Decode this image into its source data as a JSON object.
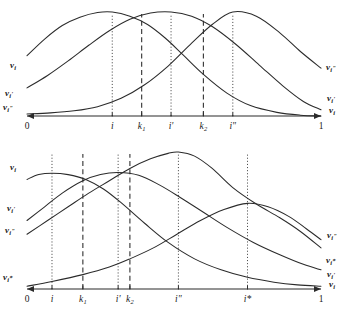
{
  "figure": {
    "title": "",
    "background": "#ffffff",
    "ink": "#2b2b2b"
  },
  "chart_data": [
    {
      "type": "line",
      "id": "top-panel",
      "title": "",
      "xlabel": "",
      "ylabel": "",
      "xlim": [
        0,
        1
      ],
      "ylim": [
        0,
        1
      ],
      "grid": false,
      "legend_position": "inline-curve-ends",
      "xtick_labels": [
        "0",
        "i",
        "k₁",
        "i'",
        "k₂",
        "i\"",
        "1"
      ],
      "xtick_values": [
        0.0,
        0.29,
        0.39,
        0.49,
        0.6,
        0.7,
        1.0
      ],
      "vertical_lines": [
        {
          "at": "i",
          "x": 0.29,
          "style": "dotted"
        },
        {
          "at": "k₁",
          "x": 0.39,
          "style": "dashed"
        },
        {
          "at": "i'",
          "x": 0.49,
          "style": "dotted"
        },
        {
          "at": "k₂",
          "x": 0.6,
          "style": "dashed"
        },
        {
          "at": "i\"",
          "x": 0.7,
          "style": "dotted"
        }
      ],
      "series": [
        {
          "name": "v_i",
          "label_left": "v",
          "label_left_sub": "i",
          "label_left_sup": "",
          "label_right": "",
          "peak_x": 0.29,
          "x": [
            0.0,
            0.06,
            0.12,
            0.18,
            0.24,
            0.29,
            0.35,
            0.41,
            0.47,
            0.53,
            0.6,
            0.68,
            0.76,
            0.85,
            0.93,
            1.0
          ],
          "y": [
            0.58,
            0.74,
            0.87,
            0.95,
            0.995,
            1.0,
            0.96,
            0.88,
            0.75,
            0.59,
            0.4,
            0.22,
            0.1,
            0.035,
            0.008,
            0.0
          ]
        },
        {
          "name": "v_i'",
          "label_left": "v",
          "label_left_sub": "i",
          "label_left_sup": "'",
          "label_right": "",
          "peak_x": 0.49,
          "x": [
            0.0,
            0.07,
            0.14,
            0.21,
            0.28,
            0.35,
            0.42,
            0.49,
            0.56,
            0.63,
            0.71,
            0.79,
            0.87,
            0.94,
            1.0
          ],
          "y": [
            0.27,
            0.39,
            0.53,
            0.68,
            0.82,
            0.93,
            0.99,
            1.0,
            0.96,
            0.86,
            0.69,
            0.49,
            0.29,
            0.14,
            0.06
          ]
        },
        {
          "name": "v_i\"",
          "label_left": "v",
          "label_left_sub": "i",
          "label_left_sup": "\"",
          "label_right": "",
          "peak_x": 0.7,
          "x": [
            0.0,
            0.08,
            0.16,
            0.24,
            0.32,
            0.4,
            0.48,
            0.56,
            0.63,
            0.7,
            0.78,
            0.86,
            0.93,
            1.0
          ],
          "y": [
            0.02,
            0.03,
            0.05,
            0.09,
            0.17,
            0.3,
            0.48,
            0.7,
            0.88,
            1.0,
            0.96,
            0.8,
            0.62,
            0.46
          ]
        }
      ],
      "left_labels": [
        "v_i",
        "v_i'",
        "v_i\""
      ],
      "right_labels": [
        "v_i\"",
        "v_i'",
        "v_i"
      ]
    },
    {
      "type": "line",
      "id": "bottom-panel",
      "title": "",
      "xlabel": "",
      "ylabel": "",
      "xlim": [
        0,
        1
      ],
      "ylim": [
        0,
        1
      ],
      "grid": false,
      "legend_position": "inline-curve-ends",
      "xtick_labels": [
        "0",
        "i",
        "k₁",
        "i'",
        "k₂",
        "i\"",
        "i*",
        "1"
      ],
      "xtick_values": [
        0.0,
        0.085,
        0.19,
        0.31,
        0.35,
        0.515,
        0.75,
        1.0
      ],
      "vertical_lines": [
        {
          "at": "i",
          "x": 0.085,
          "style": "dotted"
        },
        {
          "at": "k₁",
          "x": 0.19,
          "style": "dashed"
        },
        {
          "at": "i'",
          "x": 0.31,
          "style": "dotted"
        },
        {
          "at": "k₂",
          "x": 0.35,
          "style": "dashed"
        },
        {
          "at": "i\"",
          "x": 0.515,
          "style": "dotted"
        },
        {
          "at": "i*",
          "x": 0.75,
          "style": "dotted"
        }
      ],
      "series": [
        {
          "name": "v_i",
          "label_left": "v_i",
          "label_right": "v_i",
          "peak_x": 0.085,
          "x": [
            0.0,
            0.04,
            0.085,
            0.14,
            0.2,
            0.26,
            0.32,
            0.4,
            0.48,
            0.57,
            0.66,
            0.75,
            0.84,
            0.92,
            1.0
          ],
          "y": [
            0.8,
            0.835,
            0.845,
            0.835,
            0.8,
            0.73,
            0.63,
            0.48,
            0.34,
            0.22,
            0.14,
            0.085,
            0.05,
            0.03,
            0.02
          ]
        },
        {
          "name": "v_i'",
          "label_left": "v_i'",
          "label_right": "v_i'",
          "peak_x": 0.31,
          "x": [
            0.0,
            0.06,
            0.12,
            0.19,
            0.25,
            0.31,
            0.38,
            0.45,
            0.52,
            0.6,
            0.68,
            0.77,
            0.86,
            0.94,
            1.0
          ],
          "y": [
            0.5,
            0.6,
            0.7,
            0.79,
            0.835,
            0.85,
            0.83,
            0.76,
            0.67,
            0.56,
            0.45,
            0.34,
            0.25,
            0.18,
            0.14
          ]
        },
        {
          "name": "v_i\"",
          "label_left": "v_i\"",
          "label_right": "v_i\"",
          "peak_x": 0.515,
          "x": [
            0.0,
            0.07,
            0.14,
            0.21,
            0.28,
            0.35,
            0.42,
            0.48,
            0.515,
            0.57,
            0.63,
            0.7,
            0.78,
            0.86,
            0.93,
            1.0
          ],
          "y": [
            0.4,
            0.5,
            0.6,
            0.7,
            0.79,
            0.88,
            0.95,
            0.99,
            1.0,
            0.97,
            0.88,
            0.74,
            0.62,
            0.52,
            0.42,
            0.3
          ]
        },
        {
          "name": "v_i*",
          "label_left": "v_i*",
          "label_right": "v_i*",
          "peak_x": 0.75,
          "x": [
            0.0,
            0.085,
            0.19,
            0.28,
            0.35,
            0.43,
            0.51,
            0.59,
            0.67,
            0.75,
            0.82,
            0.89,
            0.95,
            1.0
          ],
          "y": [
            0.02,
            0.055,
            0.105,
            0.16,
            0.22,
            0.3,
            0.4,
            0.5,
            0.58,
            0.625,
            0.6,
            0.53,
            0.44,
            0.36
          ]
        }
      ],
      "left_labels": [
        "v_i",
        "v_i'",
        "v_i\"",
        "v_i*"
      ],
      "right_labels": [
        "v_i\"",
        "v_i*",
        "v_i'",
        "v_i"
      ]
    }
  ],
  "labels": {
    "top": {
      "left": [
        {
          "base": "v",
          "sub": "i",
          "sup": ""
        },
        {
          "base": "v",
          "sub": "i",
          "sup": "'"
        },
        {
          "base": "v",
          "sub": "i",
          "sup": "\""
        }
      ],
      "right": [
        {
          "base": "v",
          "sub": "i",
          "sup": "\""
        },
        {
          "base": "v",
          "sub": "i",
          "sup": "'"
        },
        {
          "base": "v",
          "sub": "i",
          "sup": ""
        }
      ],
      "ticks": [
        {
          "text": "0",
          "italic": false
        },
        {
          "text": "i",
          "italic": true
        },
        {
          "text": "k",
          "sub": "1",
          "italic": true
        },
        {
          "text": "i'",
          "italic": true
        },
        {
          "text": "k",
          "sub": "2",
          "italic": true
        },
        {
          "text": "i\"",
          "italic": true
        },
        {
          "text": "1",
          "italic": false
        }
      ]
    },
    "bottom": {
      "left": [
        {
          "base": "v",
          "sub": "i",
          "sup": ""
        },
        {
          "base": "v",
          "sub": "i",
          "sup": "'"
        },
        {
          "base": "v",
          "sub": "i",
          "sup": "\""
        },
        {
          "base": "v",
          "sub": "i",
          "sup": "*"
        }
      ],
      "right": [
        {
          "base": "v",
          "sub": "i",
          "sup": "\""
        },
        {
          "base": "v",
          "sub": "i",
          "sup": "*"
        },
        {
          "base": "v",
          "sub": "i",
          "sup": "'"
        },
        {
          "base": "v",
          "sub": "i",
          "sup": ""
        }
      ],
      "ticks": [
        {
          "text": "0",
          "italic": false
        },
        {
          "text": "i",
          "italic": true
        },
        {
          "text": "k",
          "sub": "1",
          "italic": true
        },
        {
          "text": "i'",
          "italic": true
        },
        {
          "text": "k",
          "sub": "2",
          "italic": true
        },
        {
          "text": "i\"",
          "italic": true
        },
        {
          "text": "i*",
          "italic": true
        },
        {
          "text": "1",
          "italic": false
        }
      ]
    }
  }
}
